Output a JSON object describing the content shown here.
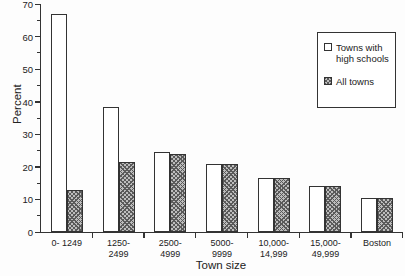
{
  "figure": {
    "background": "#fdfdfd",
    "line_color": "#333333",
    "hatch_fill_color": "#bdbdbd"
  },
  "chart_data": {
    "type": "bar",
    "categories": [
      "0- 1249",
      "1250-\n2499",
      "2500-\n4999",
      "5000-\n9999",
      "10,000-\n14,999",
      "15,000-\n49,999",
      "Boston"
    ],
    "series": [
      {
        "name": "Towns with high schools",
        "style": "white",
        "values": [
          67,
          38.5,
          24.5,
          21,
          16.5,
          14,
          10.5
        ]
      },
      {
        "name": "All towns",
        "style": "hatched",
        "values": [
          13,
          21.5,
          24,
          21,
          16.5,
          14,
          10.5
        ]
      }
    ],
    "title": "",
    "xlabel": "Town size",
    "ylabel": "Percent",
    "ylim": [
      0,
      70
    ],
    "ytick_step": 10,
    "ytick_minor_step": 5,
    "grid": false,
    "legend_position": "upper-right-box"
  }
}
